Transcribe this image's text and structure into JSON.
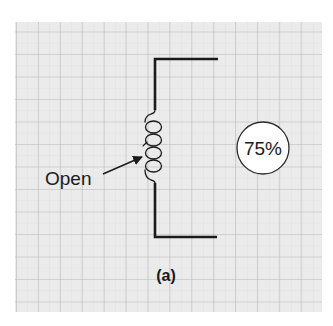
{
  "figure": {
    "label_open": "Open",
    "percentage": "75%",
    "caption": "(a)"
  },
  "colors": {
    "paper": "#ebebeb",
    "grid_major": "#b9b9b9",
    "grid_minor": "#dadada",
    "ink": "#1a1a1a",
    "badge_fill": "#ffffff"
  }
}
